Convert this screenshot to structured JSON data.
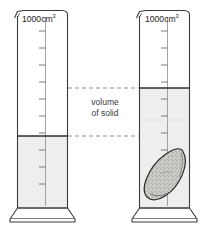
{
  "figure": {
    "annotation": {
      "line1": "volume",
      "line2": "of solid"
    }
  },
  "colors": {
    "outline": "#3c3c3c",
    "water_fill": "#efeeec",
    "water_surface": "#2d2d2d",
    "solid_fill": "#cfcdc9",
    "solid_outline": "#2a2a2a",
    "dashed_line": "#8a8a8a",
    "text": "#2b2b2b",
    "background": "#ffffff"
  },
  "cylinders": [
    {
      "id": "left",
      "name": "measuring-cylinder-before",
      "capacity_value": "1000",
      "capacity_unit": "cm",
      "capacity_unit_sup": "3",
      "capacity_label": "1000 cm³",
      "water_level_y": 136,
      "water_level_reading": "400",
      "contains_solid": false,
      "tick_count": 10
    },
    {
      "id": "right",
      "name": "measuring-cylinder-after",
      "capacity_value": "1000",
      "capacity_unit": "cm",
      "capacity_unit_sup": "3",
      "capacity_label": "1000 cm³",
      "water_level_y": 88,
      "water_level_reading": "700",
      "contains_solid": true,
      "solid_label": "irregular solid",
      "tick_count": 10
    }
  ],
  "measurement": {
    "upper_dashed_line_y": 88,
    "lower_dashed_line_y": 136,
    "difference_label": "volume of solid"
  }
}
